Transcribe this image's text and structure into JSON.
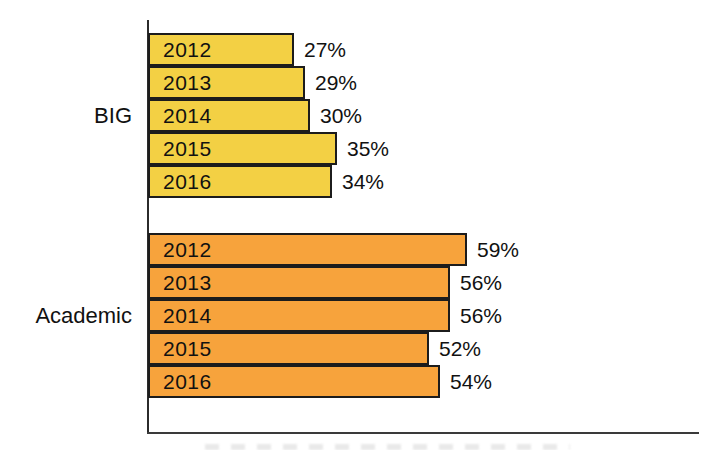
{
  "chart_data": {
    "type": "bar",
    "orientation": "horizontal",
    "title": "",
    "xlabel": "",
    "ylabel": "",
    "xlim": [
      0,
      100
    ],
    "grid": false,
    "legend": "none",
    "value_suffix": "%",
    "categories": [
      "2012",
      "2013",
      "2014",
      "2015",
      "2016"
    ],
    "series": [
      {
        "name": "BIG",
        "color": "#F3D044",
        "border_color": "#1c1c1c",
        "values": [
          27,
          29,
          30,
          35,
          34
        ]
      },
      {
        "name": "Academic",
        "color": "#F7A33C",
        "border_color": "#1c1c1c",
        "values": [
          59,
          56,
          56,
          52,
          54
        ]
      }
    ],
    "bar_labels": {
      "category_position": "inside-bar-left",
      "value_position": "outside-bar-right"
    }
  },
  "colors": {
    "background": "#ffffff",
    "axis": "#2b2b2b",
    "text": "#111111"
  }
}
